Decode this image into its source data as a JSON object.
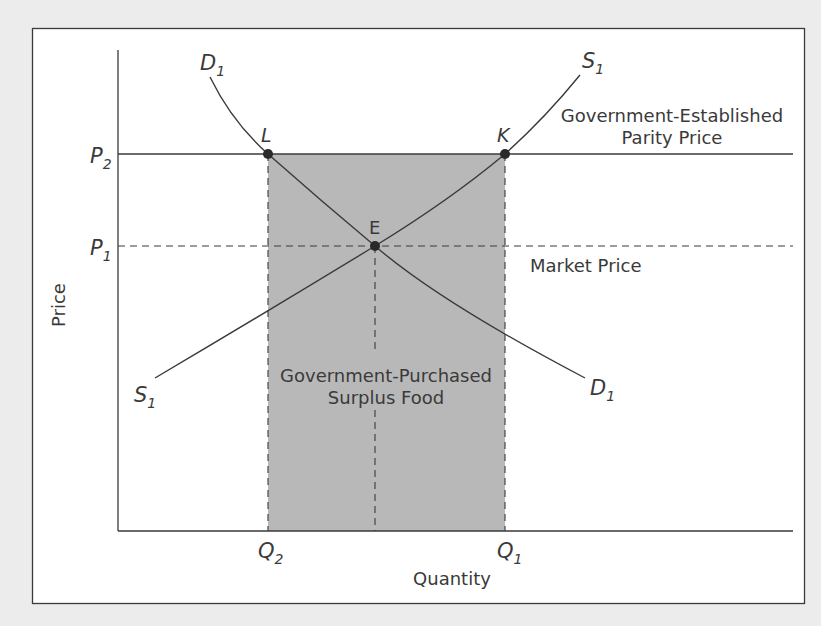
{
  "figure": {
    "type": "supply-demand-price-support",
    "y_axis_label": "Price",
    "x_axis_label": "Quantity",
    "price_levels": [
      {
        "symbol": "P",
        "sub": "2",
        "meaning": "Government-Established Parity Price",
        "line_style": "solid"
      },
      {
        "symbol": "P",
        "sub": "1",
        "meaning": "Market Price",
        "line_style": "dashed"
      }
    ],
    "quantity_levels": [
      {
        "symbol": "Q",
        "sub": "2"
      },
      {
        "symbol": "Q",
        "sub": "1"
      }
    ],
    "curves": [
      {
        "name": "D",
        "sub": "1",
        "kind": "demand"
      },
      {
        "name": "S",
        "sub": "1",
        "kind": "supply"
      }
    ],
    "points": [
      {
        "label": "L",
        "at": "P2 on D1"
      },
      {
        "label": "K",
        "at": "P2 on S1"
      },
      {
        "label": "E",
        "at": "equilibrium P1"
      }
    ],
    "annotations": {
      "parity_line1": "Government-Established",
      "parity_line2": "Parity Price",
      "market_price": "Market Price",
      "surplus_line1": "Government-Purchased",
      "surplus_line2": "Surplus Food"
    }
  },
  "labels": {
    "D_top": "D",
    "D_top_sub": "1",
    "D_bottom": "D",
    "D_bottom_sub": "1",
    "S_top": "S",
    "S_top_sub": "1",
    "S_bottom": "S",
    "S_bottom_sub": "1",
    "P2": "P",
    "P2_sub": "2",
    "P1": "P",
    "P1_sub": "1",
    "Q2": "Q",
    "Q2_sub": "2",
    "Q1": "Q",
    "Q1_sub": "1",
    "L": "L",
    "K": "K",
    "E": "E",
    "price": "Price",
    "quantity": "Quantity",
    "parity_1": "Government-Established",
    "parity_2": "Parity Price",
    "market": "Market Price",
    "surplus_1": "Government-Purchased",
    "surplus_2": "Surplus Food"
  },
  "colors": {
    "background": "#ececec",
    "plot_bg": "#ffffff",
    "shade": "#b8b8b8",
    "ink": "#3a3a3a"
  }
}
